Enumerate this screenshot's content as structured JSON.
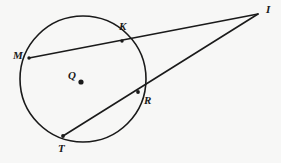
{
  "figure": {
    "kind": "circle-geometry-diagram",
    "background_color": "#f7f7f6",
    "stroke_color": "#1a1a1a",
    "width": 281,
    "height": 163
  },
  "circle": {
    "name": "circle-Q",
    "center_label": "Q",
    "center_x": 83,
    "center_y": 79,
    "radius": 63,
    "stroke_width": 1.6
  },
  "points": [
    {
      "id": "M",
      "label": "M",
      "x": 29,
      "y": 58,
      "label_x": 13,
      "label_y": 50,
      "on_circle": true
    },
    {
      "id": "K",
      "label": "K",
      "x": 122,
      "y": 41,
      "label_x": 119,
      "label_y": 21,
      "on_circle": true
    },
    {
      "id": "I",
      "label": "I",
      "x": 258,
      "y": 14,
      "label_x": 266,
      "label_y": 4,
      "on_circle": false
    },
    {
      "id": "R",
      "label": "R",
      "x": 138,
      "y": 92,
      "label_x": 144,
      "label_y": 95,
      "on_circle": true
    },
    {
      "id": "T",
      "label": "T",
      "x": 63,
      "y": 136,
      "label_x": 58,
      "label_y": 143,
      "on_circle": true
    },
    {
      "id": "Q",
      "label": "Q",
      "x": 81,
      "y": 82,
      "label_x": 68,
      "label_y": 70,
      "on_circle": false
    }
  ],
  "lines": [
    {
      "id": "secant-MKI",
      "label": "M-K-I",
      "x1": 29,
      "y1": 58,
      "x2": 258,
      "y2": 14,
      "stroke_width": 1.6
    },
    {
      "id": "secant-TRI",
      "label": "T-R-I",
      "x1": 63,
      "y1": 136,
      "x2": 258,
      "y2": 14,
      "stroke_width": 1.6
    }
  ],
  "dots": [
    {
      "id": "dot-Q",
      "x": 81,
      "y": 82,
      "r": 2.6
    },
    {
      "id": "dot-M",
      "x": 29,
      "y": 58,
      "r": 1.7
    },
    {
      "id": "dot-K",
      "x": 122,
      "y": 41,
      "r": 1.7
    },
    {
      "id": "dot-R",
      "x": 138,
      "y": 92,
      "r": 1.9
    },
    {
      "id": "dot-T",
      "x": 63,
      "y": 136,
      "r": 1.9
    }
  ]
}
